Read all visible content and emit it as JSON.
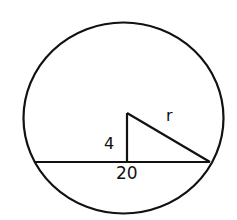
{
  "diagram": {
    "type": "circle-chord-right-triangle",
    "stroke_color": "#111111",
    "background_color": "#ffffff",
    "labels": {
      "height": "4",
      "radius": "r",
      "chord": "20"
    }
  }
}
